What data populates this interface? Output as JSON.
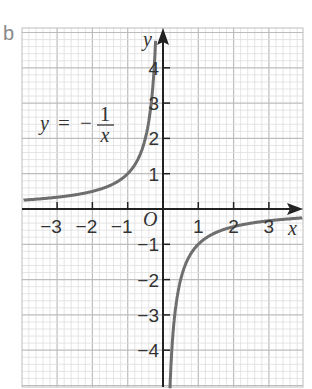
{
  "panel_label": "b",
  "chart_data": {
    "type": "line",
    "title": "",
    "equation": {
      "lhs": "y",
      "equals": "=",
      "sign": "−",
      "numerator": "1",
      "denominator": "x"
    },
    "xlabel": "x",
    "ylabel": "y",
    "origin_label": "O",
    "xlim": [
      -3.95,
      3.95
    ],
    "ylim": [
      -5,
      5.1
    ],
    "grid": true,
    "x_ticks": [
      -3,
      -2,
      -1,
      1,
      2,
      3
    ],
    "x_tick_labels": [
      "−3",
      "−2",
      "−1",
      "1",
      "2",
      "3"
    ],
    "y_ticks": [
      4,
      3,
      2,
      1,
      -1,
      -2,
      -3,
      -4
    ],
    "y_tick_labels": [
      "4",
      "3",
      "2",
      "1",
      "−1",
      "−2",
      "−3",
      "−4"
    ],
    "series": [
      {
        "name": "y = -1/x (x<0)",
        "x": [
          -3.95,
          -3,
          -2,
          -1,
          -0.5,
          -0.25,
          -0.21
        ],
        "y": [
          0.25,
          0.333,
          0.5,
          1,
          2,
          4,
          4.8
        ]
      },
      {
        "name": "y = -1/x (x>0)",
        "x": [
          0.2,
          0.25,
          0.5,
          1,
          2,
          3,
          3.95
        ],
        "y": [
          -5,
          -4,
          -2,
          -1,
          -0.5,
          -0.333,
          -0.25
        ]
      }
    ],
    "colors": {
      "curve": "#6e6e6e",
      "axes": "#222222",
      "grid_major": "#bdbdbd",
      "grid_minor": "#dedede",
      "panel_label": "#8a8a8a"
    }
  }
}
